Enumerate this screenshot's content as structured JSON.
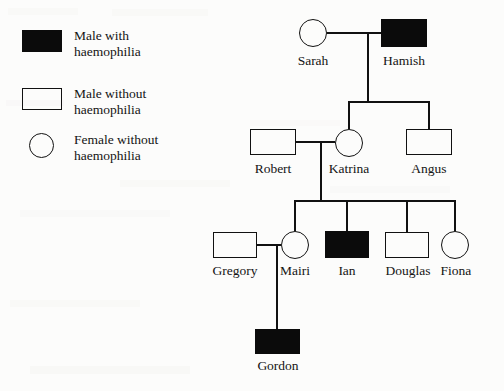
{
  "diagram": {
    "type": "pedigree-chart",
    "colors": {
      "affected_fill": "#0b0b0b",
      "unaffected_fill": "#ffffff",
      "stroke": "#111111",
      "background": "#fcfcfb"
    }
  },
  "legend": {
    "items": [
      {
        "symbol": "filled-square",
        "line1": "Male with",
        "line2": "haemophilia"
      },
      {
        "symbol": "open-square",
        "line1": "Male without",
        "line2": "haemophilia"
      },
      {
        "symbol": "open-circle",
        "line1": "Female without",
        "line2": "haemophilia"
      }
    ]
  },
  "pedigree": {
    "generations": [
      {
        "id": "I",
        "individuals": [
          {
            "name": "Sarah",
            "sex": "female",
            "affected": false,
            "symbol": "open-circle"
          },
          {
            "name": "Hamish",
            "sex": "male",
            "affected": true,
            "symbol": "filled-square"
          }
        ]
      },
      {
        "id": "II",
        "individuals": [
          {
            "name": "Robert",
            "sex": "male",
            "affected": false,
            "symbol": "open-square"
          },
          {
            "name": "Katrina",
            "sex": "female",
            "affected": false,
            "symbol": "open-circle"
          },
          {
            "name": "Angus",
            "sex": "male",
            "affected": false,
            "symbol": "open-square"
          }
        ]
      },
      {
        "id": "III",
        "individuals": [
          {
            "name": "Gregory",
            "sex": "male",
            "affected": false,
            "symbol": "open-square"
          },
          {
            "name": "Mairi",
            "sex": "female",
            "affected": false,
            "symbol": "open-circle"
          },
          {
            "name": "Ian",
            "sex": "male",
            "affected": true,
            "symbol": "filled-square"
          },
          {
            "name": "Douglas",
            "sex": "male",
            "affected": false,
            "symbol": "open-square"
          },
          {
            "name": "Fiona",
            "sex": "female",
            "affected": false,
            "symbol": "open-circle"
          }
        ]
      },
      {
        "id": "IV",
        "individuals": [
          {
            "name": "Gordon",
            "sex": "male",
            "affected": true,
            "symbol": "filled-square"
          }
        ]
      }
    ],
    "matings": [
      {
        "partners": [
          "Sarah",
          "Hamish"
        ],
        "children": [
          "Katrina",
          "Angus"
        ]
      },
      {
        "partners": [
          "Robert",
          "Katrina"
        ],
        "children": [
          "Mairi",
          "Ian",
          "Douglas",
          "Fiona"
        ]
      },
      {
        "partners": [
          "Gregory",
          "Mairi"
        ],
        "children": [
          "Gordon"
        ]
      }
    ]
  }
}
